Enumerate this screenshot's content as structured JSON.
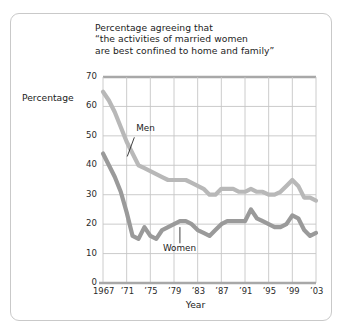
{
  "figure": {
    "title_lines": [
      "Percentage agreeing that",
      "“the activities of married women",
      "are best confined to home and family”"
    ],
    "ylabel": "Percentage",
    "xlabel": "Year"
  },
  "chart_data": {
    "type": "line",
    "title": "Percentage agreeing that “the activities of married women are best confined to home and family”",
    "xlabel": "Year",
    "ylabel": "Percentage",
    "xlim": [
      1967,
      2003
    ],
    "ylim": [
      0,
      70
    ],
    "yticks": [
      0,
      10,
      20,
      30,
      40,
      50,
      60,
      70
    ],
    "ytick_labels": [
      "0",
      "10",
      "20",
      "30",
      "40",
      "50",
      "60",
      "70"
    ],
    "xticks": [
      1967,
      1971,
      1975,
      1979,
      1983,
      1987,
      1991,
      1995,
      1999,
      2003
    ],
    "xtick_labels": [
      "1967",
      "’71",
      "’75",
      "’79",
      "’83",
      "’87",
      "’91",
      "’95",
      "’99",
      "’03"
    ],
    "grid": true,
    "grid_color": "#c6c6c6",
    "legend": "annotations",
    "annotations": [
      {
        "name": "Men",
        "text": "Men",
        "x": 1972.6,
        "y": 52.5
      },
      {
        "name": "Women",
        "text": "Women",
        "x": 1980.0,
        "y": 11.5
      }
    ],
    "series": [
      {
        "name": "Men",
        "color": "#b8b8b8",
        "x": [
          1967,
          1968,
          1969,
          1970,
          1971,
          1972,
          1973,
          1974,
          1975,
          1976,
          1977,
          1978,
          1979,
          1980,
          1981,
          1982,
          1983,
          1984,
          1985,
          1986,
          1987,
          1988,
          1989,
          1990,
          1991,
          1992,
          1993,
          1994,
          1995,
          1996,
          1997,
          1998,
          1999,
          2000,
          2001,
          2002,
          2003
        ],
        "y": [
          65,
          62,
          58,
          53,
          48,
          44,
          40,
          39,
          38,
          37,
          36,
          35,
          35,
          35,
          35,
          34,
          33,
          32,
          30,
          30,
          32,
          32,
          32,
          31,
          31,
          32,
          31,
          31,
          30,
          30,
          31,
          33,
          35,
          33,
          29,
          29,
          28
        ]
      },
      {
        "name": "Women",
        "color": "#9a9a9a",
        "x": [
          1967,
          1968,
          1969,
          1970,
          1971,
          1972,
          1973,
          1974,
          1975,
          1976,
          1977,
          1978,
          1979,
          1980,
          1981,
          1982,
          1983,
          1984,
          1985,
          1986,
          1987,
          1988,
          1989,
          1990,
          1991,
          1992,
          1993,
          1994,
          1995,
          1996,
          1997,
          1998,
          1999,
          2000,
          2001,
          2002,
          2003
        ],
        "y": [
          44,
          40,
          36,
          31,
          24,
          16,
          15,
          19,
          16,
          15,
          18,
          19,
          20,
          21,
          21,
          20,
          18,
          17,
          16,
          18,
          20,
          21,
          21,
          21,
          21,
          25,
          22,
          21,
          20,
          19,
          19,
          20,
          23,
          22,
          18,
          16,
          17
        ]
      }
    ]
  },
  "geometry": {
    "plot_left": 103,
    "plot_right": 316,
    "plot_top": 77,
    "plot_bottom": 283
  }
}
